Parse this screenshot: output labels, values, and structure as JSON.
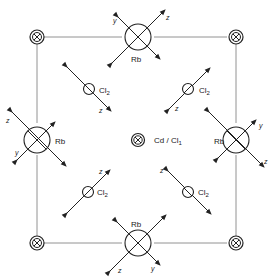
{
  "diagram": {
    "type": "crystal-structure-projection",
    "unit_cell_corners": [
      "Cd/Cl1",
      "Cd/Cl1",
      "Cd/Cl1",
      "Cd/Cl1"
    ],
    "atoms": {
      "corner": {
        "symbol": "corner-site",
        "count": 4
      },
      "rb": [
        {
          "label": "Rb",
          "position": "top",
          "axis_labels": {
            "y": "y",
            "z": "z"
          }
        },
        {
          "label": "Rb",
          "position": "left",
          "axis_labels": {
            "z": "z",
            "y": "y"
          }
        },
        {
          "label": "Rb",
          "position": "right",
          "axis_labels": {
            "y": "y",
            "z": "z"
          }
        },
        {
          "label": "Rb",
          "position": "bottom",
          "axis_labels": {
            "z": "z",
            "y": "y"
          }
        }
      ],
      "center": {
        "label": "Cd / Cl",
        "subscript": "1"
      },
      "cl2": [
        {
          "label": "Cl",
          "subscript": "2",
          "position": "upper-left",
          "axis": "z"
        },
        {
          "label": "Cl",
          "subscript": "2",
          "position": "upper-right",
          "axis": "z"
        },
        {
          "label": "Cl",
          "subscript": "2",
          "position": "lower-left",
          "axis": "z"
        },
        {
          "label": "Cl",
          "subscript": "2",
          "position": "lower-right",
          "axis": "z"
        }
      ]
    }
  }
}
